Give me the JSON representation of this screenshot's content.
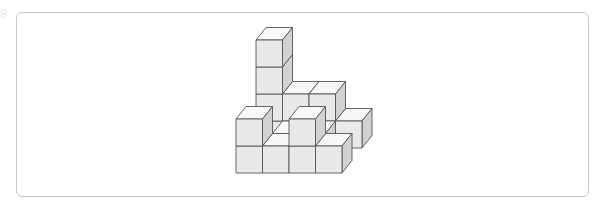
{
  "corner_fragment": "8",
  "figure": {
    "colors": {
      "front": "#e9e9e9",
      "top": "#f8f8f8",
      "side": "#d2d2d2",
      "edge": "#555555",
      "panel_border": "#c8c8c8"
    },
    "projection": {
      "origin_x": 236,
      "origin_y": 173,
      "cube_w": 26.5,
      "cube_h": 27,
      "depth_dx": 10,
      "depth_dy": -12.5
    },
    "cubes": [
      {
        "x": 0,
        "z": 2,
        "y": 0
      },
      {
        "x": 0,
        "z": 2,
        "y": 1
      },
      {
        "x": 0,
        "z": 2,
        "y": 2
      },
      {
        "x": 0,
        "z": 2,
        "y": 3
      },
      {
        "x": 1,
        "z": 2,
        "y": 0
      },
      {
        "x": 1,
        "z": 2,
        "y": 1
      },
      {
        "x": 2,
        "z": 2,
        "y": 0
      },
      {
        "x": 2,
        "z": 2,
        "y": 1
      },
      {
        "x": 3,
        "z": 2,
        "y": 0
      },
      {
        "x": 1,
        "z": 1,
        "y": 0
      },
      {
        "x": 2,
        "z": 1,
        "y": 0
      },
      {
        "x": 0,
        "z": 0,
        "y": 0
      },
      {
        "x": 0,
        "z": 0,
        "y": 1
      },
      {
        "x": 1,
        "z": 0,
        "y": 0
      },
      {
        "x": 2,
        "z": 0,
        "y": 0
      },
      {
        "x": 2,
        "z": 0,
        "y": 1
      },
      {
        "x": 3,
        "z": 0,
        "y": 0
      }
    ]
  }
}
